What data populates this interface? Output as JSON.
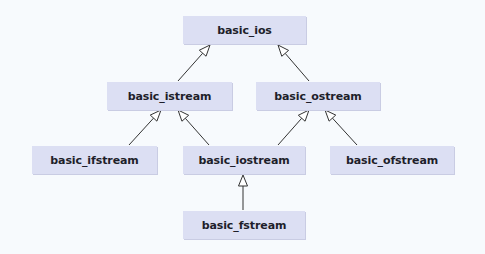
{
  "diagram": {
    "type": "class-inheritance-hierarchy",
    "colors": {
      "background": "#f7fafd",
      "node_fill": "#dcdff3",
      "node_text": "#1e1e2a",
      "edge": "#333333",
      "arrowhead_fill": "#ffffff"
    },
    "nodes": [
      {
        "id": "basic_ios",
        "label": "basic_ios"
      },
      {
        "id": "basic_istream",
        "label": "basic_istream"
      },
      {
        "id": "basic_ostream",
        "label": "basic_ostream"
      },
      {
        "id": "basic_ifstream",
        "label": "basic_ifstream"
      },
      {
        "id": "basic_iostream",
        "label": "basic_iostream"
      },
      {
        "id": "basic_ofstream",
        "label": "basic_ofstream"
      },
      {
        "id": "basic_fstream",
        "label": "basic_fstream"
      }
    ],
    "edges": [
      {
        "from": "basic_istream",
        "to": "basic_ios",
        "relation": "inherits"
      },
      {
        "from": "basic_ostream",
        "to": "basic_ios",
        "relation": "inherits"
      },
      {
        "from": "basic_ifstream",
        "to": "basic_istream",
        "relation": "inherits"
      },
      {
        "from": "basic_iostream",
        "to": "basic_istream",
        "relation": "inherits"
      },
      {
        "from": "basic_iostream",
        "to": "basic_ostream",
        "relation": "inherits"
      },
      {
        "from": "basic_ofstream",
        "to": "basic_ostream",
        "relation": "inherits"
      },
      {
        "from": "basic_fstream",
        "to": "basic_iostream",
        "relation": "inherits"
      }
    ]
  }
}
